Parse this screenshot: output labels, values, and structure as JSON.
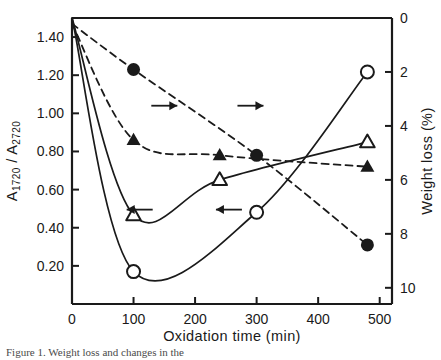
{
  "figure": {
    "caption": "Figure 1. Weight loss and changes in the",
    "background": "#ffffff",
    "ink": "#1a1a1a"
  },
  "chart_data": {
    "type": "scatter",
    "title": "",
    "xlabel": "Oxidation time   (min)",
    "ylabel": "A1720 / A2720",
    "y2label": "Weight loss  (%)",
    "xlim": [
      0,
      520
    ],
    "ylim": [
      0,
      1.5
    ],
    "y2lim": [
      0,
      10.6
    ],
    "y2_inverted": true,
    "grid": false,
    "legend": "none",
    "xticks": [
      0,
      100,
      200,
      300,
      400,
      500
    ],
    "xtick_labels": [
      "0",
      "100",
      "200",
      "300",
      "400",
      "500"
    ],
    "yticks": [
      0.2,
      0.4,
      0.6,
      0.8,
      1.0,
      1.2,
      1.4
    ],
    "ytick_labels": [
      "0.20",
      "0.40",
      "0.60",
      "0.80",
      "1.00",
      "1.20",
      "1.40"
    ],
    "y2ticks": [
      0,
      2,
      4,
      6,
      8,
      10
    ],
    "y2tick_labels": [
      "0",
      "2",
      "4",
      "6",
      "8",
      "10"
    ],
    "series": [
      {
        "name": "filled-circle-absorbance-ratio",
        "marker": "filled-circle",
        "line": "dashed",
        "axis": "left",
        "x": [
          0,
          100,
          300,
          480
        ],
        "values": [
          1.47,
          1.23,
          0.78,
          0.31
        ]
      },
      {
        "name": "filled-triangle-absorbance-ratio",
        "marker": "filled-triangle",
        "line": "dashed",
        "axis": "left",
        "x": [
          0,
          100,
          240,
          480
        ],
        "values": [
          1.47,
          0.86,
          0.78,
          0.72
        ]
      },
      {
        "name": "open-triangle-weight-loss",
        "marker": "open-triangle",
        "line": "solid",
        "axis": "right",
        "x": [
          0,
          100,
          240,
          480
        ],
        "values": [
          0.0,
          7.3,
          6.0,
          4.6
        ]
      },
      {
        "name": "open-circle-weight-loss",
        "marker": "open-circle",
        "line": "solid",
        "axis": "right",
        "x": [
          0,
          100,
          300,
          480
        ],
        "values": [
          0.0,
          9.4,
          7.2,
          2.0
        ]
      }
    ],
    "annotations": [
      {
        "name": "arrow-right-upper-left",
        "symbol": "→",
        "x": 150,
        "y_left": 1.04
      },
      {
        "name": "arrow-right-upper-right",
        "symbol": "→",
        "x": 290,
        "y_left": 1.04
      },
      {
        "name": "arrow-left-lower-left",
        "symbol": "←",
        "x": 110,
        "y_left": 0.495
      },
      {
        "name": "arrow-left-lower-right",
        "symbol": "←",
        "x": 255,
        "y_left": 0.495
      }
    ]
  }
}
